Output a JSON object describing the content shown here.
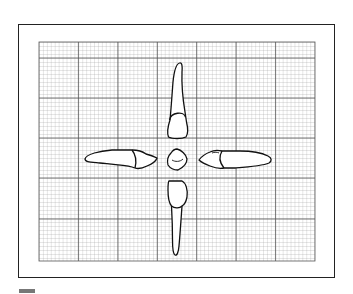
{
  "figure": {
    "views": [
      {
        "id": "top",
        "label": "labial/facial view (root up)"
      },
      {
        "id": "bottom",
        "label": "lingual view (root down)"
      },
      {
        "id": "left",
        "label": "proximal view (crown right)"
      },
      {
        "id": "right",
        "label": "proximal view (crown left)"
      },
      {
        "id": "center",
        "label": "incisal view"
      }
    ],
    "grid": {
      "major_columns": 7,
      "minor_per_major": 10,
      "line_color": "#555555",
      "minor_color": "#9a9a9a"
    },
    "colors": {
      "frame": "#222222",
      "outline": "#111111",
      "scale_bar": "#777777"
    }
  }
}
